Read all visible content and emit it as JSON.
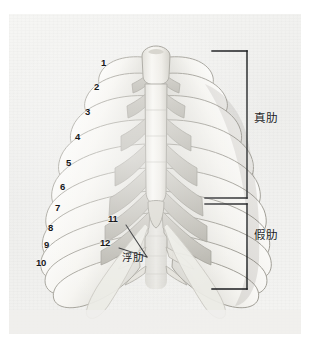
{
  "figure": {
    "kind": "anatomical-illustration",
    "panel_background": "#f1f1ef",
    "ink_color": "#16181a"
  },
  "rib_numbers": [
    {
      "id": "rib-1",
      "label": "1",
      "x": 101,
      "y": 63
    },
    {
      "id": "rib-2",
      "label": "2",
      "x": 94,
      "y": 87
    },
    {
      "id": "rib-3",
      "label": "3",
      "x": 85,
      "y": 112
    },
    {
      "id": "rib-4",
      "label": "4",
      "x": 75,
      "y": 137
    },
    {
      "id": "rib-5",
      "label": "5",
      "x": 66,
      "y": 163
    },
    {
      "id": "rib-6",
      "label": "6",
      "x": 60,
      "y": 187
    },
    {
      "id": "rib-7",
      "label": "7",
      "x": 55,
      "y": 208
    },
    {
      "id": "rib-8",
      "label": "8",
      "x": 48,
      "y": 228
    },
    {
      "id": "rib-9",
      "label": "9",
      "x": 44,
      "y": 245
    },
    {
      "id": "rib-10",
      "label": "10",
      "x": 38,
      "y": 263
    },
    {
      "id": "rib-11",
      "label": "11",
      "x": 111,
      "y": 218
    },
    {
      "id": "rib-12",
      "label": "12",
      "x": 103,
      "y": 243
    }
  ],
  "leaders": {
    "converge_point": {
      "x": 147,
      "y": 256
    },
    "from_11": {
      "x": 126,
      "y": 224
    },
    "from_12": {
      "x": 119,
      "y": 247
    }
  },
  "callouts": {
    "floating_ribs": {
      "label": "浮肋",
      "x": 124,
      "y": 258
    }
  },
  "brackets": [
    {
      "id": "true-ribs-bracket",
      "label": "真肋",
      "label_x": 255,
      "label_y": 119,
      "x_vertical": 247,
      "y_top": 50,
      "y_bottom": 197,
      "tick_x_end": 212
    },
    {
      "id": "false-ribs-bracket",
      "label": "假肋",
      "label_x": 255,
      "label_y": 236,
      "x_vertical": 247,
      "y_top": 203,
      "y_bottom": 288,
      "tick_x_end": 205
    }
  ]
}
